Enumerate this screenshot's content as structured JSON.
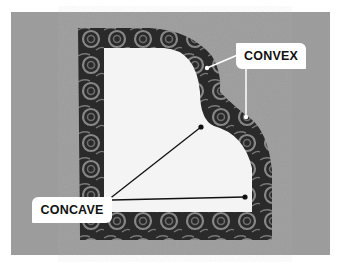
{
  "image": {
    "description": "Photo of patterned fabric with white paper template showing curved edges",
    "background_color": "#9c9c9c",
    "fabric_color": "#2a2a2a",
    "template_color": "#f4f4f4",
    "swirl_color": "#8a8a8a"
  },
  "labels": {
    "convex": "CONVEX",
    "concave": "CONCAVE"
  }
}
